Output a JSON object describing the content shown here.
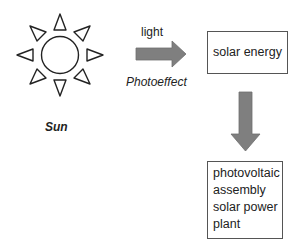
{
  "diagram": {
    "sun": {
      "icon": "sun-icon",
      "label": "Sun"
    },
    "arrow_right": {
      "label_above": "light",
      "label_below": "Photoeffect",
      "color": "#7f7f7f"
    },
    "box1": {
      "text": "solar energy"
    },
    "arrow_down": {
      "color": "#7f7f7f"
    },
    "box2": {
      "lines": [
        "photovoltaic",
        "assembly",
        "solar power",
        "plant"
      ]
    }
  }
}
